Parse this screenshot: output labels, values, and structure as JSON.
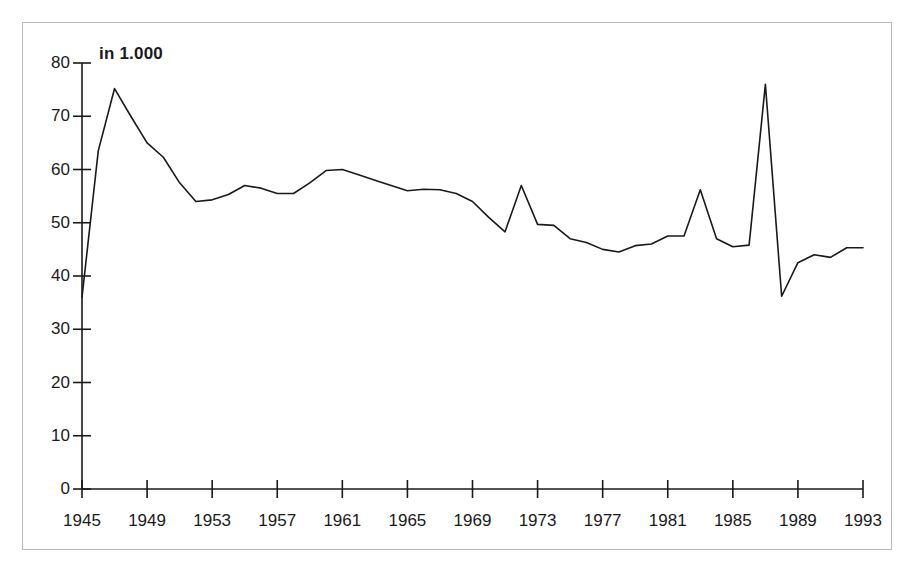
{
  "chart_data": {
    "type": "line",
    "title": "",
    "unit_note": "in 1.000",
    "xlabel": "",
    "ylabel": "",
    "xlim": [
      1945,
      1993
    ],
    "ylim": [
      0,
      80
    ],
    "ytick_values": [
      0,
      10,
      20,
      30,
      40,
      50,
      60,
      70,
      80
    ],
    "ytick_labels": [
      "0",
      "10",
      "20",
      "30",
      "40",
      "50",
      "60",
      "70",
      "80"
    ],
    "xtick_values": [
      1945,
      1949,
      1953,
      1957,
      1961,
      1965,
      1969,
      1973,
      1977,
      1981,
      1985,
      1989,
      1993
    ],
    "xtick_labels": [
      "1945",
      "1949",
      "1953",
      "1957",
      "1961",
      "1965",
      "1969",
      "1973",
      "1977",
      "1981",
      "1985",
      "1989",
      "1993"
    ],
    "grid": false,
    "legend": false,
    "line_color": "#1a1a1a",
    "line_width": 1.6,
    "x": [
      1945,
      1946,
      1947,
      1948,
      1949,
      1950,
      1951,
      1952,
      1953,
      1954,
      1955,
      1956,
      1957,
      1958,
      1959,
      1960,
      1961,
      1962,
      1963,
      1964,
      1965,
      1966,
      1967,
      1968,
      1969,
      1970,
      1971,
      1972,
      1973,
      1974,
      1975,
      1976,
      1977,
      1978,
      1979,
      1980,
      1981,
      1982,
      1983,
      1984,
      1985,
      1986,
      1987,
      1988,
      1989,
      1990,
      1991,
      1992,
      1993
    ],
    "values": [
      36.0,
      63.5,
      75.2,
      70.0,
      65.0,
      62.3,
      57.5,
      54.0,
      54.3,
      55.3,
      57.0,
      56.5,
      55.5,
      55.5,
      57.5,
      59.8,
      60.0,
      59.0,
      58.0,
      57.0,
      56.0,
      56.3,
      56.2,
      55.5,
      54.0,
      51.0,
      48.3,
      57.0,
      49.7,
      49.5,
      47.0,
      46.3,
      45.0,
      44.5,
      45.7,
      46.0,
      47.5,
      47.5,
      56.2,
      47.0,
      45.5,
      45.8,
      76.0,
      36.2,
      42.5,
      44.0,
      43.5,
      45.3,
      45.3
    ],
    "series_name": ""
  },
  "axes": {
    "y_axis_label_unit": "in 1.000"
  }
}
